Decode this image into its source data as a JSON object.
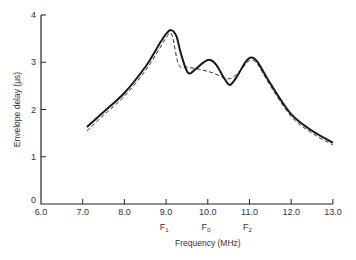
{
  "chart_data": {
    "type": "line",
    "title": "",
    "xlabel": "Frequency (MHz)",
    "ylabel": "Envelope delay (μs)",
    "xlim": [
      6.0,
      13.0
    ],
    "ylim": [
      0,
      4
    ],
    "grid": false,
    "legend": null,
    "x_ticks": [
      "6.0",
      "7.0",
      "8.0",
      "9.0",
      "10.0",
      "11.0",
      "12.0",
      "13.0"
    ],
    "y_ticks": [
      "0",
      "1",
      "2",
      "3",
      "4"
    ],
    "frequency_markers": [
      {
        "x": 9.0,
        "label": "F",
        "sub": "1"
      },
      {
        "x": 10.0,
        "label": "F",
        "sub": "0"
      },
      {
        "x": 11.0,
        "label": "F",
        "sub": "2"
      }
    ],
    "series": [
      {
        "name": "solid",
        "style": "solid",
        "x": [
          7.1,
          7.5,
          8.0,
          8.5,
          8.85,
          9.0,
          9.12,
          9.25,
          9.35,
          9.52,
          9.7,
          9.9,
          10.05,
          10.2,
          10.4,
          10.53,
          10.7,
          10.9,
          11.04,
          11.2,
          11.5,
          12.0,
          12.5,
          13.0
        ],
        "values": [
          1.63,
          1.95,
          2.35,
          2.9,
          3.4,
          3.6,
          3.68,
          3.55,
          3.2,
          2.78,
          2.85,
          3.0,
          3.05,
          2.95,
          2.65,
          2.52,
          2.7,
          3.0,
          3.1,
          3.0,
          2.55,
          1.9,
          1.55,
          1.3
        ]
      },
      {
        "name": "dashed",
        "style": "dashed",
        "x": [
          7.1,
          7.5,
          8.0,
          8.5,
          8.85,
          9.05,
          9.15,
          9.3,
          9.5,
          9.8,
          10.1,
          10.5,
          10.75,
          10.95,
          11.05,
          11.2,
          11.5,
          12.0,
          12.5,
          13.0
        ],
        "values": [
          1.55,
          1.88,
          2.28,
          2.82,
          3.3,
          3.58,
          3.55,
          2.95,
          2.9,
          2.85,
          2.78,
          2.65,
          2.8,
          3.0,
          3.05,
          2.95,
          2.5,
          1.85,
          1.5,
          1.25
        ]
      }
    ]
  }
}
